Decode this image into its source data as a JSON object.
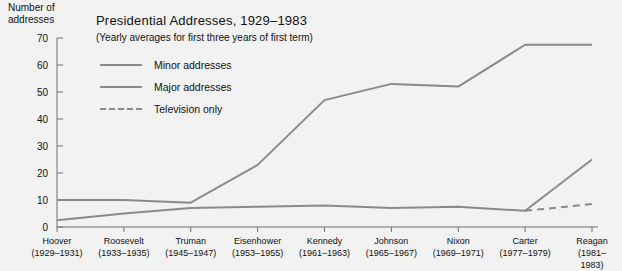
{
  "chart_data": {
    "type": "line",
    "title": "Presidential Addresses, 1929–1983",
    "subtitle": "(Yearly averages for first three years of first term)",
    "ylabel": "Number of\naddresses",
    "xlabel": "",
    "ylim": [
      0,
      70
    ],
    "yticks": [
      0,
      10,
      20,
      30,
      40,
      50,
      60,
      70
    ],
    "ytick_labels": [
      "0",
      "10",
      "20",
      "30",
      "40",
      "50",
      "60",
      "70"
    ],
    "grid": false,
    "legend_position": "inside top-left",
    "categories": [
      "Hoover",
      "Roosevelt",
      "Truman",
      "Eisenhower",
      "Kennedy",
      "Johnson",
      "Nixon",
      "Carter",
      "Reagan"
    ],
    "category_years": [
      "(1929–1931)",
      "(1933–1935)",
      "(1945–1947)",
      "(1953–1955)",
      "(1961–1963)",
      "(1965–1967)",
      "(1969–1971)",
      "(1977–1979)",
      "(1981–1983)"
    ],
    "series": [
      {
        "name": "Minor addresses",
        "style": "solid",
        "color": "#8a8a8a",
        "values": [
          10,
          10,
          9,
          23,
          47,
          53,
          52,
          67.5,
          67.5
        ]
      },
      {
        "name": "Major addresses",
        "style": "solid",
        "color": "#8a8a8a",
        "values": [
          2.5,
          5,
          7,
          7.5,
          8,
          7,
          7.5,
          6,
          25
        ]
      },
      {
        "name": "Television only",
        "style": "dashed",
        "color": "#8a8a8a",
        "values": [
          null,
          null,
          null,
          null,
          null,
          null,
          null,
          6,
          8.5
        ]
      }
    ]
  },
  "legend": [
    {
      "label": "Minor addresses",
      "style": "solid"
    },
    {
      "label": "Major addresses",
      "style": "solid"
    },
    {
      "label": "Television only",
      "style": "dashed"
    }
  ],
  "colors": {
    "background": "#f2f2f2",
    "line": "#8a8a8a",
    "axis": "#6e6e6e",
    "text": "#111111"
  }
}
